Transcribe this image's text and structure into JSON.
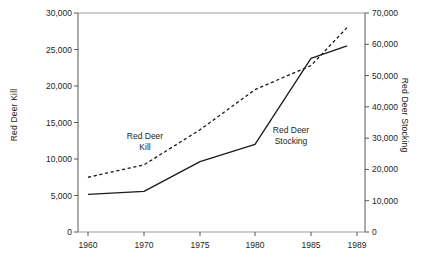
{
  "chart_data": {
    "type": "line",
    "title": "",
    "xlabel": "",
    "categories": [
      "1960",
      "1970",
      "1975",
      "1980",
      "1985",
      "1989"
    ],
    "grid": false,
    "legend_position": "inline-annotations",
    "axes": {
      "left": {
        "label": "Red Deer Kill",
        "ylim": [
          0,
          30000
        ],
        "tick_step": 5000,
        "ticks": [
          "0",
          "5,000",
          "10,000",
          "15,000",
          "20,000",
          "25,000",
          "30,000"
        ],
        "tick_values": [
          0,
          5000,
          10000,
          15000,
          20000,
          25000,
          30000
        ]
      },
      "right": {
        "label": "Red Deer Stocking",
        "ylim": [
          0,
          70000
        ],
        "tick_step": 10000,
        "ticks": [
          "0",
          "10,000",
          "20,000",
          "30,000",
          "40,000",
          "50,000",
          "60,000",
          "70,000"
        ],
        "tick_values": [
          0,
          10000,
          20000,
          30000,
          40000,
          50000,
          60000,
          70000
        ]
      }
    },
    "series": [
      {
        "name": "Red Deer Kill",
        "axis": "left",
        "style": "dashed",
        "color": "#1a1a1a",
        "annotation": "Red Deer\nKill",
        "values": [
          7500,
          9200,
          14000,
          19500,
          22800,
          28000
        ]
      },
      {
        "name": "Red Deer Stocking",
        "axis": "right",
        "style": "solid",
        "color": "#1a1a1a",
        "annotation": "Red Deer\nStocking",
        "values": [
          12000,
          13000,
          22500,
          28000,
          55500,
          59500
        ]
      }
    ]
  },
  "annotations": {
    "kill_line1": "Red Deer",
    "kill_line2": "Kill",
    "stocking_line1": "Red Deer",
    "stocking_line2": "Stocking"
  },
  "colors": {
    "axis": "#58595b",
    "ink": "#231f20",
    "series": "#1a1a1a",
    "background": "#ffffff"
  }
}
